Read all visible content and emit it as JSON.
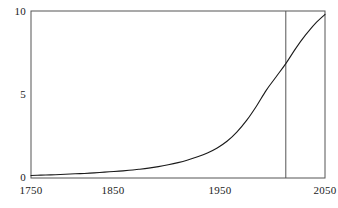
{
  "figure": {
    "background": "#ffffff",
    "frame_color": "#555555",
    "curve_color": "#1a1a1a",
    "marker_line_color": "#555555"
  },
  "chart_data": {
    "type": "line",
    "title": "",
    "subtitle": "",
    "xlabel": "",
    "ylabel": "",
    "xlim": [
      1750,
      2050
    ],
    "ylim": [
      0,
      10
    ],
    "grid": false,
    "legend": null,
    "x_ticks": [
      1750,
      1850,
      1950,
      2050
    ],
    "x_tick_labels": [
      "1750",
      "1850",
      "1950",
      "2050"
    ],
    "y_ticks": [
      0,
      5,
      10
    ],
    "y_tick_labels": [
      "0",
      "5",
      "10"
    ],
    "annotations": [
      {
        "name": "vertical-reference-line",
        "type": "vline",
        "x": 2010,
        "label": ""
      }
    ],
    "series": [
      {
        "name": "population",
        "x": [
          1750,
          1760,
          1770,
          1780,
          1790,
          1800,
          1810,
          1820,
          1830,
          1840,
          1850,
          1860,
          1870,
          1880,
          1890,
          1900,
          1910,
          1920,
          1930,
          1940,
          1950,
          1960,
          1970,
          1980,
          1990,
          2000,
          2010,
          2020,
          2030,
          2040,
          2050
        ],
        "values": [
          0.15,
          0.17,
          0.19,
          0.21,
          0.24,
          0.26,
          0.29,
          0.33,
          0.37,
          0.41,
          0.46,
          0.52,
          0.59,
          0.68,
          0.79,
          0.92,
          1.08,
          1.27,
          1.5,
          1.8,
          2.2,
          2.75,
          3.45,
          4.3,
          5.25,
          6.05,
          6.85,
          7.75,
          8.55,
          9.25,
          9.8
        ]
      }
    ]
  },
  "axis_labels": {
    "x": [
      {
        "name": "x-tick-1750",
        "text": "1750"
      },
      {
        "name": "x-tick-1850",
        "text": "1850"
      },
      {
        "name": "x-tick-1950",
        "text": "1950"
      },
      {
        "name": "x-tick-2050",
        "text": "2050"
      }
    ],
    "y": [
      {
        "name": "y-tick-0",
        "text": "0"
      },
      {
        "name": "y-tick-5",
        "text": "5"
      },
      {
        "name": "y-tick-10",
        "text": "10"
      }
    ]
  }
}
